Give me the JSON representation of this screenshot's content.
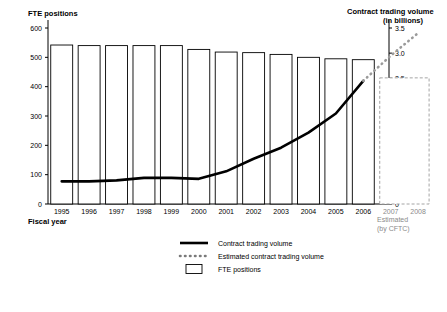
{
  "titles": {
    "left_axis": "FTE positions",
    "right_axis_line1": "Contract trading volume",
    "right_axis_line2": "(in billions)",
    "x_axis": "Fiscal year"
  },
  "legend": [
    {
      "key": "line",
      "label": "Contract trading volume"
    },
    {
      "key": "dotted",
      "label": "Estimated contract trading volume"
    },
    {
      "key": "bar",
      "label": "FTE positions"
    }
  ],
  "estimated_note": {
    "line1": "Estimated",
    "line2": "(by CFTC)"
  },
  "chart_data": {
    "type": "bar",
    "title": "",
    "xlabel": "Fiscal year",
    "ylabel": "FTE positions",
    "y2label": "Contract trading volume (in billions)",
    "categories": [
      "1995",
      "1996",
      "1997",
      "1998",
      "1999",
      "2000",
      "2001",
      "2002",
      "2003",
      "2004",
      "2005",
      "2006",
      "2007",
      "2008"
    ],
    "ylim": [
      0,
      600
    ],
    "yticks": [
      0,
      100,
      200,
      300,
      400,
      500,
      600
    ],
    "y2lim": [
      0,
      3.5
    ],
    "y2ticks": [
      0.0,
      0.5,
      1.0,
      1.5,
      2.0,
      2.5,
      3.0,
      3.5
    ],
    "y2ticklabels": [
      "0",
      "0.5",
      "1.0",
      "1.5",
      "2.0",
      "2.5",
      "3.0",
      "3.5"
    ],
    "grid": false,
    "series": [
      {
        "name": "FTE positions",
        "type": "bar",
        "axis": "left",
        "style": "open",
        "values": [
          542,
          540,
          540,
          540,
          540,
          527,
          518,
          516,
          510,
          500,
          495,
          492,
          null,
          null
        ]
      },
      {
        "name": "FTE positions (estimated)",
        "type": "bar",
        "axis": "left",
        "style": "dashed-open",
        "values": [
          null,
          null,
          null,
          null,
          null,
          null,
          null,
          null,
          null,
          null,
          null,
          null,
          430,
          430
        ]
      },
      {
        "name": "Contract trading volume",
        "type": "line",
        "axis": "right",
        "style": "solid-thick",
        "values": [
          0.45,
          0.45,
          0.47,
          0.52,
          0.52,
          0.5,
          0.65,
          0.9,
          1.12,
          1.42,
          1.8,
          2.45,
          null,
          null
        ]
      },
      {
        "name": "Estimated contract trading volume",
        "type": "line",
        "axis": "right",
        "style": "dotted",
        "values": [
          null,
          null,
          null,
          null,
          null,
          null,
          null,
          null,
          null,
          null,
          null,
          2.45,
          2.95,
          3.4
        ]
      }
    ]
  }
}
